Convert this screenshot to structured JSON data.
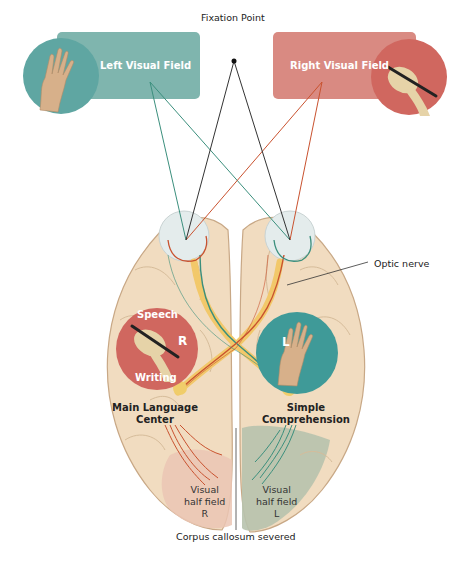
{
  "diagram": {
    "colors": {
      "left_field": "#7fb5ae",
      "right_field": "#d98a82",
      "teal_circle": "#3f9a98",
      "red_circle": "#d0675f",
      "brain": "#f1dcc0",
      "brain_line": "#c8a886",
      "green_path": "#3b8f7d",
      "red_path": "#c9522f",
      "fixation_line": "#333333",
      "left_vision_gray": "#b7c2ad",
      "right_vision_pink": "#ebc6b4"
    }
  },
  "labels": {
    "left_visual_field": "Left Visual Field",
    "right_visual_field": "Right Visual Field",
    "fixation_point": "Fixation Point",
    "optic_nerve": "Optic nerve",
    "speech": "Speech",
    "writing": "Writing",
    "right_hemisphere_letter": "R",
    "left_hemisphere_letter": "L",
    "main_language_center_line1": "Main Language",
    "main_language_center_line2": "Center",
    "simple_comprehension_line1": "Simple",
    "simple_comprehension_line2": "Comprehension",
    "visual_half_field_r_line1": "Visual",
    "visual_half_field_r_line2": "half field",
    "visual_half_field_r_line3": "R",
    "visual_half_field_l_line1": "Visual",
    "visual_half_field_l_line2": "half field",
    "visual_half_field_l_line3": "L",
    "corpus_callosum": "Corpus callosum severed"
  },
  "icons": {
    "left_hand": "open-hand-icon",
    "right_hand_writing": "hand-writing-pen-icon"
  }
}
